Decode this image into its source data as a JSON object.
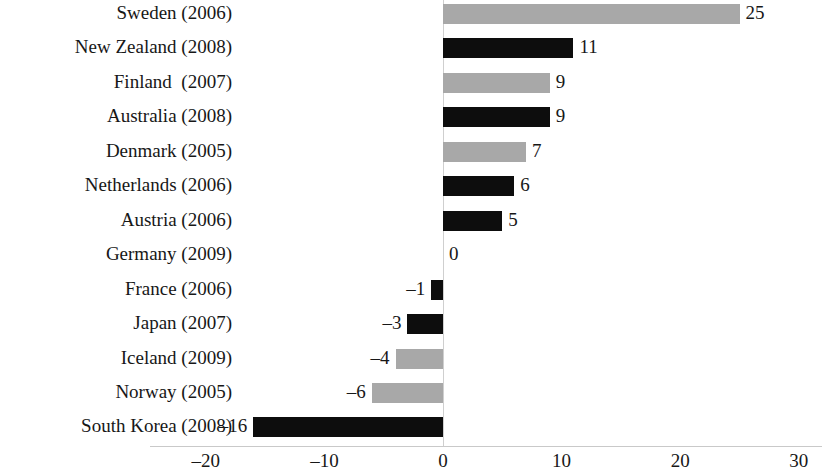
{
  "chart_data": {
    "type": "bar",
    "orientation": "horizontal",
    "title": "",
    "subtitle": "",
    "xlabel": "",
    "ylabel": "",
    "xlim": [
      -20,
      30
    ],
    "xticks": [
      -20,
      -10,
      0,
      10,
      20,
      30
    ],
    "xtick_labels": [
      "–20",
      "–10",
      "0",
      "10",
      "20",
      "30"
    ],
    "grid": false,
    "legend": "none",
    "zero_reference_line": true,
    "bar_colors": {
      "gray": "#a8a8a8",
      "black": "#0d0d0d"
    },
    "categories": [
      "Sweden (2006)",
      "New Zealand (2008)",
      "Finland  (2007)",
      "Australia (2008)",
      "Denmark (2005)",
      "Netherlands (2006)",
      "Austria (2006)",
      "Germany (2009)",
      "France (2006)",
      "Japan (2007)",
      "Iceland (2009)",
      "Norway (2005)",
      "South Korea (2008)"
    ],
    "values": [
      25,
      11,
      9,
      9,
      7,
      6,
      5,
      0,
      -1,
      -3,
      -4,
      -6,
      -16
    ],
    "value_labels": [
      "25",
      "11",
      "9",
      "9",
      "7",
      "6",
      "5",
      "0",
      "–1",
      "–3",
      "–4",
      "–6",
      "–16"
    ],
    "colors": [
      "gray",
      "black",
      "gray",
      "black",
      "gray",
      "black",
      "black",
      "none",
      "black",
      "black",
      "gray",
      "gray",
      "black"
    ],
    "bars": [
      {
        "category": "Sweden (2006)",
        "value": 25,
        "label": "25",
        "color": "gray"
      },
      {
        "category": "New Zealand (2008)",
        "value": 11,
        "label": "11",
        "color": "black"
      },
      {
        "category": "Finland  (2007)",
        "value": 9,
        "label": "9",
        "color": "gray"
      },
      {
        "category": "Australia (2008)",
        "value": 9,
        "label": "9",
        "color": "black"
      },
      {
        "category": "Denmark (2005)",
        "value": 7,
        "label": "7",
        "color": "gray"
      },
      {
        "category": "Netherlands (2006)",
        "value": 6,
        "label": "6",
        "color": "black"
      },
      {
        "category": "Austria (2006)",
        "value": 5,
        "label": "5",
        "color": "black"
      },
      {
        "category": "Germany (2009)",
        "value": 0,
        "label": "0",
        "color": "none"
      },
      {
        "category": "France (2006)",
        "value": -1,
        "label": "–1",
        "color": "black"
      },
      {
        "category": "Japan (2007)",
        "value": -3,
        "label": "–3",
        "color": "black"
      },
      {
        "category": "Iceland (2009)",
        "value": -4,
        "label": "–4",
        "color": "gray"
      },
      {
        "category": "Norway (2005)",
        "value": -6,
        "label": "–6",
        "color": "gray"
      },
      {
        "category": "South Korea (2008)",
        "value": -16,
        "label": "–16",
        "color": "black"
      }
    ]
  }
}
